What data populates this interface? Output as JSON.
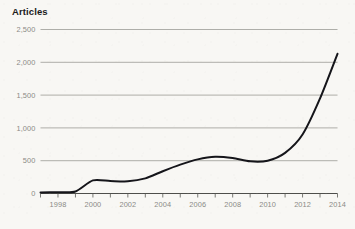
{
  "chart_data": {
    "type": "line",
    "title": "Articles",
    "xlabel": "",
    "ylabel": "Articles",
    "grid": true,
    "legend": "none",
    "xlim": [
      1997,
      2014
    ],
    "ylim": [
      0,
      2500
    ],
    "y_ticks": [
      0,
      500,
      1000,
      1500,
      2000,
      2500
    ],
    "y_tick_labels": [
      "0",
      "500",
      "1,000",
      "1,500",
      "2,000",
      "2,500"
    ],
    "x_ticks": [
      1998,
      2000,
      2002,
      2004,
      2006,
      2008,
      2010,
      2012,
      2014
    ],
    "x_tick_labels": [
      "1998",
      "2000",
      "2002",
      "2004",
      "2006",
      "2008",
      "2010",
      "2012",
      "2014"
    ],
    "x_minor_ticks": [
      1997,
      1998,
      1999,
      2000,
      2001,
      2002,
      2003,
      2004,
      2005,
      2006,
      2007,
      2008,
      2009,
      2010,
      2011,
      2012,
      2013,
      2014
    ],
    "series": [
      {
        "name": "Articles",
        "color": "#15151a",
        "x": [
          1997,
          1998,
          1999,
          2000,
          2001,
          2002,
          2003,
          2004,
          2005,
          2006,
          2007,
          2008,
          2009,
          2010,
          2011,
          2012,
          2013,
          2014
        ],
        "values": [
          15,
          20,
          30,
          200,
          190,
          185,
          230,
          340,
          440,
          520,
          560,
          540,
          490,
          500,
          620,
          900,
          1450,
          2130
        ]
      }
    ]
  },
  "axis": {
    "y_label_color": "#8b8b86",
    "x_label_color": "#8b8b86",
    "gridline_color": "#8e8e88",
    "axis_color": "#3a3a38",
    "line_color": "#15151a"
  },
  "canvas": {
    "background": "#f8f7f4",
    "width": 355,
    "height": 229
  }
}
